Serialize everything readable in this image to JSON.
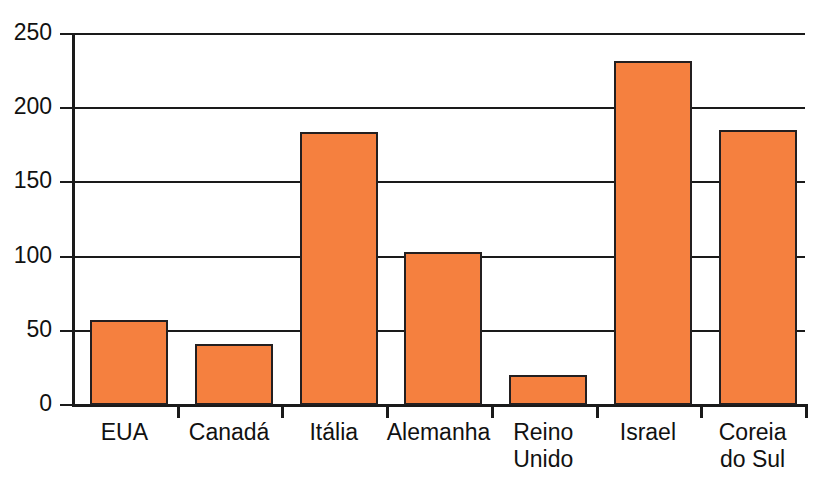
{
  "chart_data": {
    "type": "bar",
    "title": "",
    "subtitle": "",
    "xlabel": "",
    "ylabel": "",
    "categories": [
      "EUA",
      "Canadá",
      "Itália",
      "Alemanha",
      "Reino Unido",
      "Israel",
      "Coreia do Sul"
    ],
    "category_labels_multiline": [
      "EUA",
      "Canadá",
      "Itália",
      "Alemanha",
      "Reino\nUnido",
      "Israel",
      "Coreia\ndo Sul"
    ],
    "values": [
      57,
      41,
      184,
      103,
      20,
      232,
      185
    ],
    "ylim": [
      0,
      250
    ],
    "yticks": [
      0,
      50,
      100,
      150,
      200,
      250
    ],
    "ytick_labels": [
      "0",
      "50",
      "100",
      "150",
      "200",
      "250"
    ],
    "grid": true,
    "grid_axis": "y",
    "legend": null,
    "legend_position": "none",
    "series": [
      {
        "name": "",
        "values": [
          57,
          41,
          184,
          103,
          20,
          232,
          185
        ]
      }
    ],
    "bar_color": "#f5803f",
    "bar_border_color": "#231f20",
    "axis_color": "#1a1a1a",
    "background_color": "#ffffff"
  }
}
